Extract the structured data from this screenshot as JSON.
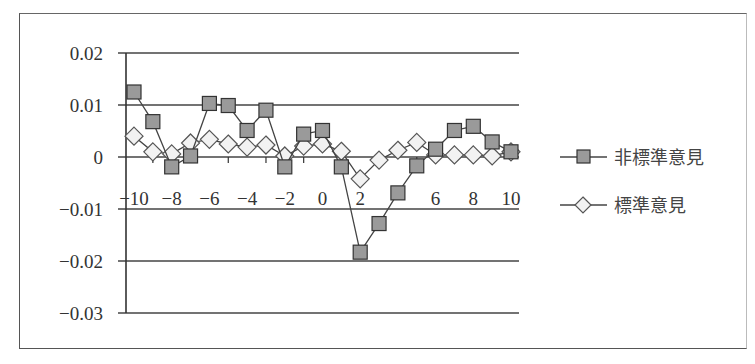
{
  "chart_data": {
    "type": "line",
    "title": "",
    "xlabel": "",
    "ylabel": "",
    "x": [
      -10,
      -9,
      -8,
      -7,
      -6,
      -5,
      -4,
      -3,
      -2,
      -1,
      0,
      1,
      2,
      3,
      4,
      5,
      6,
      7,
      8,
      9,
      10
    ],
    "x_tick_labels": [
      "-10",
      "-8",
      "-6",
      "-4",
      "-2",
      "0",
      "2",
      "4",
      "6",
      "8",
      "10"
    ],
    "x_tick_labels_visible": [
      "-10",
      "-8",
      "-6",
      "-4",
      "-2",
      "0",
      "2",
      "6",
      "8",
      "10"
    ],
    "y_tick_labels": [
      "0.02",
      "0.01",
      "0",
      "-0.01",
      "-0.02",
      "-0.03"
    ],
    "ylim": [
      -0.03,
      0.02
    ],
    "xlim": [
      -10,
      10
    ],
    "grid": "horizontal",
    "legend_position": "right",
    "series": [
      {
        "name": "非標準意見",
        "marker": "square",
        "marker_fill": "#9a9a9a",
        "values": [
          0.0125,
          0.0068,
          -0.0019,
          0.0002,
          0.0103,
          0.0099,
          0.0051,
          0.009,
          -0.0019,
          0.0044,
          0.0051,
          -0.0019,
          -0.0183,
          -0.0128,
          -0.0069,
          -0.0017,
          0.0015,
          0.0051,
          0.0059,
          0.0029,
          0.001
        ]
      },
      {
        "name": "標準意見",
        "marker": "diamond",
        "marker_fill": "#f2f2f2",
        "values": [
          0.004,
          0.001,
          0.0006,
          0.0027,
          0.0034,
          0.0025,
          0.0019,
          0.0023,
          0.0002,
          0.0021,
          0.0025,
          0.0011,
          -0.0042,
          -0.0006,
          0.0013,
          0.0028,
          0.0004,
          0.0004,
          0.0004,
          0.0002,
          0.001
        ]
      }
    ]
  },
  "legend": {
    "items": [
      {
        "label": "非標準意見",
        "marker": "square"
      },
      {
        "label": "標準意見",
        "marker": "diamond"
      }
    ]
  },
  "colors": {
    "axis": "#333333",
    "grid": "#444444",
    "square_fill": "#9a9a9a",
    "diamond_fill": "#f2f2f2",
    "line": "#444444"
  }
}
